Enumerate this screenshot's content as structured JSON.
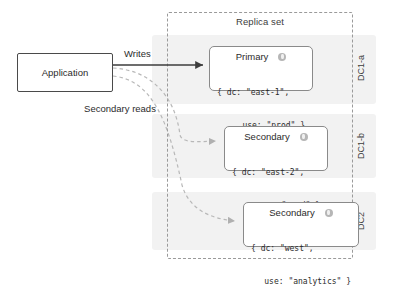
{
  "diagram": {
    "replica_set": {
      "label": "Replica set"
    },
    "application": {
      "label": "Application"
    },
    "edges": {
      "writes_label": "Writes",
      "secondary_reads_label": "Secondary reads"
    },
    "datacenters": [
      {
        "id": "dc1a",
        "label": "DC1-a"
      },
      {
        "id": "dc1b",
        "label": "DC1-b"
      },
      {
        "id": "dc2",
        "label": "DC2"
      }
    ],
    "nodes": [
      {
        "id": "primary",
        "title": "Primary",
        "icon": "database-icon",
        "tags_line1": "{ dc: \"east-1\",",
        "tags_line2": "use: \"prod\" }"
      },
      {
        "id": "secondary-1",
        "title": "Secondary",
        "icon": "database-icon",
        "tags_line1": "{ dc: \"east-2\",",
        "tags_line2": "use: \"prod\" }"
      },
      {
        "id": "secondary-2",
        "title": "Secondary",
        "icon": "database-icon",
        "tags_line1": "{ dc: \"west\",",
        "tags_line2": "use: \"analytics\" }"
      }
    ],
    "colors": {
      "band_fill": "#f2f2f2",
      "dashed_border": "#9a9a9a",
      "node_border": "#8a8a8a",
      "app_border": "#4a4a4a",
      "solid_arrow": "#3d3d3d",
      "dashed_arrow": "#b0b0b0",
      "text": "#2b2b2b"
    }
  }
}
